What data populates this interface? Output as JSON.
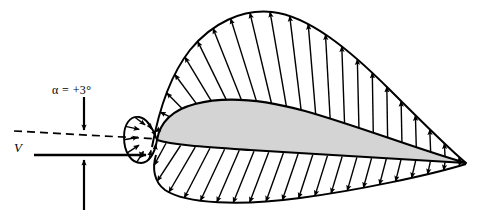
{
  "figure": {
    "background_color": "#ffffff",
    "line_color": "#000000",
    "body_fill_color": "#d4d4d4"
  },
  "labels": {
    "angle_of_attack": "α = +3°",
    "freestream_velocity": "V"
  },
  "chart_data": {
    "type": "line",
    "xlabel": "",
    "ylabel": "",
    "annotations": [
      {
        "name": "angle-of-attack",
        "text": "α = +3°",
        "x": 88,
        "y": 92
      },
      {
        "name": "freestream-velocity",
        "text": "V",
        "x": 20,
        "y": 148
      }
    ],
    "legend": [],
    "grid": false,
    "series": [
      {
        "name": "upper-surface-pressure",
        "description": "Suction (negative pressure) arrows pointing away from upper surface",
        "arrow_direction": "outward",
        "arrow_count": 22,
        "values": [
          0.18,
          0.52,
          0.78,
          0.95,
          1.0,
          0.98,
          0.94,
          0.9,
          0.86,
          0.82,
          0.77,
          0.72,
          0.67,
          0.62,
          0.56,
          0.5,
          0.44,
          0.38,
          0.31,
          0.24,
          0.16,
          0.07
        ]
      },
      {
        "name": "lower-surface-pressure",
        "description": "Positive pressure arrows pointing toward lower surface",
        "arrow_direction": "inward",
        "arrow_count": 21,
        "values": [
          0.1,
          0.34,
          0.52,
          0.62,
          0.66,
          0.67,
          0.66,
          0.64,
          0.62,
          0.59,
          0.55,
          0.51,
          0.47,
          0.42,
          0.37,
          0.32,
          0.26,
          0.21,
          0.15,
          0.09,
          0.04
        ]
      },
      {
        "name": "leading-edge-stagnation",
        "description": "High pressure arrows pointing into the nose of the airfoil",
        "arrow_direction": "inward",
        "arrow_count": 9,
        "values": [
          0.4,
          0.62,
          0.8,
          0.92,
          1.0,
          0.95,
          0.84,
          0.66,
          0.45
        ]
      }
    ],
    "geometry": {
      "chord_line_dashed": true,
      "angle_of_attack_degrees": 3,
      "leading_edge": [
        155,
        139
      ],
      "trailing_edge": [
        466,
        163
      ]
    }
  }
}
